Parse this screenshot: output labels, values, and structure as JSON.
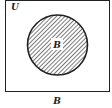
{
  "diagram": {
    "type": "venn",
    "universe_label": "U",
    "set_label": "B",
    "caption": "B",
    "shaded_region": "B",
    "colors": {
      "stroke": "#222222",
      "hatch": "#333333",
      "background": "#ffffff"
    }
  }
}
